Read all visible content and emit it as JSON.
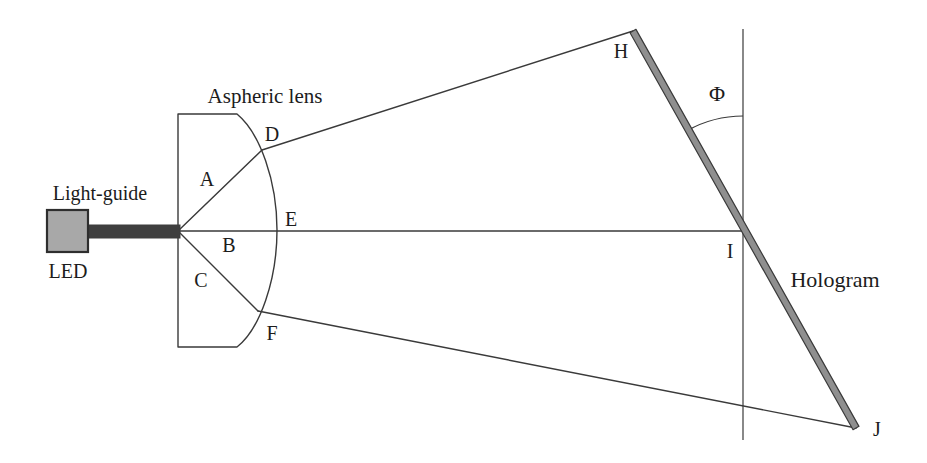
{
  "diagram": {
    "labels": {
      "aspheric_lens": "Aspheric lens",
      "light_guide": "Light-guide",
      "led": "LED",
      "hologram": "Hologram",
      "angle": "Φ"
    },
    "points": {
      "A": "A",
      "B": "B",
      "C": "C",
      "D": "D",
      "E": "E",
      "F": "F",
      "H": "H",
      "I": "I",
      "J": "J"
    }
  },
  "colors": {
    "background": "#ffffff",
    "line": "#3a3a3a",
    "text": "#1c1c1c",
    "led_fill": "#a8a8a8",
    "led_border": "#2e2e2e",
    "light_guide_fill": "#3f3f3f",
    "hologram_fill": "#8f8f8f",
    "lens_fill": "#ffffff"
  }
}
